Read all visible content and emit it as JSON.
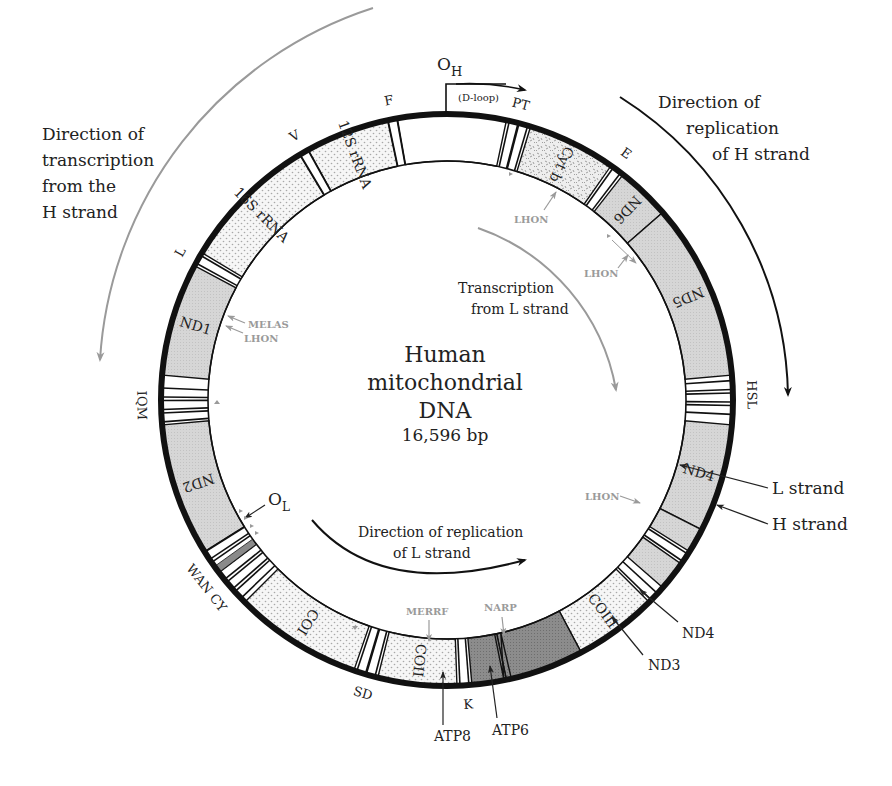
{
  "title": {
    "line1": "Human",
    "line2": "mitochondrial",
    "line3": "DNA",
    "size": "16,596 bp"
  },
  "annotations": {
    "h_transcription": [
      "Direction of",
      "transcription",
      "from the",
      "H strand"
    ],
    "h_replication": [
      "Direction of",
      "replication",
      "of H strand"
    ],
    "l_transcription": [
      "Transcription",
      "from L strand"
    ],
    "l_replication": [
      "Direction of replication",
      "of L strand"
    ],
    "origin_h": "O",
    "origin_h_sub": "H",
    "origin_l": "O",
    "origin_l_sub": "L",
    "dloop": "(D-loop)",
    "l_strand": "L strand",
    "h_strand": "H strand"
  },
  "genes": [
    {
      "name": "D-loop",
      "label": "",
      "start": -10,
      "end": 12,
      "fill": "white"
    },
    {
      "name": "Cyt b",
      "label": "Cyt b",
      "start": 17,
      "end": 35,
      "fill": "speckle"
    },
    {
      "name": "ND6",
      "label": "ND6",
      "start": 38,
      "end": 49,
      "fill": "gray"
    },
    {
      "name": "ND5",
      "label": "ND5",
      "start": 49,
      "end": 85,
      "fill": "gray"
    },
    {
      "name": "ND4",
      "label": "ND4",
      "start": 95,
      "end": 117,
      "fill": "gray"
    },
    {
      "name": "ND4L",
      "label": "",
      "start": 117,
      "end": 122,
      "fill": "gray"
    },
    {
      "name": "ND3",
      "label": "",
      "start": 125,
      "end": 131,
      "fill": "gray"
    },
    {
      "name": "COIII",
      "label": "COIII",
      "start": 135,
      "end": 152,
      "fill": "dots"
    },
    {
      "name": "ATP6",
      "label": "",
      "start": 152,
      "end": 168,
      "fill": "dark"
    },
    {
      "name": "ATP8",
      "label": "",
      "start": 168,
      "end": 175,
      "fill": "dark"
    },
    {
      "name": "COII",
      "label": "COII",
      "start": 178,
      "end": 194,
      "fill": "dots"
    },
    {
      "name": "COI",
      "label": "COI",
      "start": 199,
      "end": 225,
      "fill": "dots"
    },
    {
      "name": "ND2",
      "label": "ND2",
      "start": 238,
      "end": 265,
      "fill": "gray"
    },
    {
      "name": "ND1",
      "label": "ND1",
      "start": 275,
      "end": 298,
      "fill": "gray"
    },
    {
      "name": "16S rRNA",
      "label": "16S rRNA",
      "start": 301,
      "end": 329,
      "fill": "dots"
    },
    {
      "name": "12S rRNA",
      "label": "12S rRNA",
      "start": 331,
      "end": 348,
      "fill": "dots"
    }
  ],
  "trnas": [
    {
      "label": "F",
      "angles": [
        349
      ],
      "label_angle": 349
    },
    {
      "label": "V",
      "angles": [
        330
      ],
      "label_angle": 330
    },
    {
      "label": "L",
      "angles": [
        299.5
      ],
      "label_angle": 299
    },
    {
      "label": "IQM",
      "angles": [
        266.5,
        269,
        271.5
      ],
      "label_angle": 269
    },
    {
      "label": "WAN CY",
      "angles": [
        227,
        229.5,
        232,
        234.5,
        237
      ],
      "label_angle": 232
    },
    {
      "label": "SD",
      "angles": [
        195.5,
        197.5
      ],
      "label_angle": 196
    },
    {
      "label": "K",
      "angles": [
        176.5
      ],
      "label_angle": 176
    },
    {
      "label": "G",
      "angles": [
        133.5
      ],
      "label_angle": null
    },
    {
      "label": "R",
      "angles": [
        123.5
      ],
      "label_angle": null
    },
    {
      "label": "HSL",
      "angles": [
        87,
        89.5,
        92
      ],
      "label_angle": 89
    },
    {
      "label": "E",
      "angles": [
        36.5
      ],
      "label_angle": 36
    },
    {
      "label": "PT",
      "angles": [
        13.5,
        15.5
      ],
      "label_angle": 14
    }
  ],
  "pointer_labels": {
    "nd4l": "ND4",
    "nd3": "ND3",
    "atp8": "ATP8",
    "atp6": "ATP6"
  },
  "diseases": {
    "lhon_cytb": "LHON",
    "lhon_nd6": "LHON",
    "melas": "MELAS",
    "lhon_nd1": "LHON",
    "lhon_nd4": "LHON",
    "merrf": "MERRF",
    "narp": "NARP"
  },
  "colors": {
    "ring_outline": "#111111",
    "gene_gray": "#d4d4d4",
    "gene_dark": "#8a8a8a",
    "gene_dots_bg": "#f3f3f3",
    "disease_text": "#9a9a9a",
    "h_arrow_gray": "#9a9a9a"
  }
}
